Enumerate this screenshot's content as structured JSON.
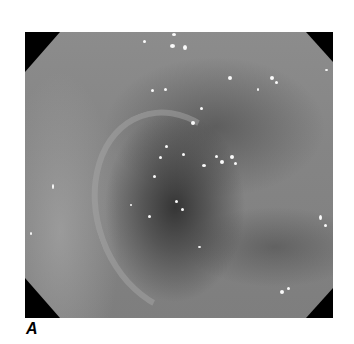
{
  "figure": {
    "panel_label": "A",
    "image": {
      "kind": "endoscopic-photograph",
      "tone": "grayscale",
      "colors": {
        "mucosa": "#858585",
        "lumen": "#3a3a3a",
        "corners": "#000000",
        "highlights": "#fafafa"
      }
    }
  }
}
